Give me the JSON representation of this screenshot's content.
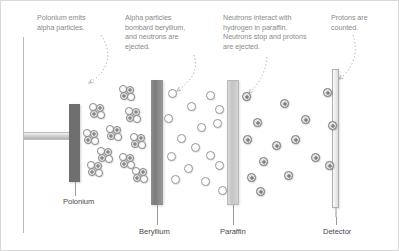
{
  "diagram": {
    "background_color": "#ffffff",
    "annotations": [
      {
        "id": "polonium-note",
        "text": "Polonium emits\nalpha particles.",
        "x": 36,
        "y": 12,
        "width": 72
      },
      {
        "id": "beryllium-note",
        "text": "Alpha particles\nbombard beryllium,\nand neutrons are\nejected.",
        "x": 124,
        "y": 12,
        "width": 76
      },
      {
        "id": "paraffin-note",
        "text": "Neutrons interact with\nhydrogen in paraffin.\nNeutrons stop and protons\nare ejected.",
        "x": 222,
        "y": 12,
        "width": 98
      },
      {
        "id": "detector-note",
        "text": "Protons are\ncounted.",
        "x": 330,
        "y": 12,
        "width": 62
      }
    ],
    "components": [
      {
        "id": "polonium",
        "label": "Polonium",
        "label_x": 62,
        "label_y": 196,
        "lead_x": 74,
        "lead_top": 181,
        "lead_height": 14,
        "color": "#6f6f6f"
      },
      {
        "id": "beryllium",
        "label": "Beryllium",
        "label_x": 138,
        "label_y": 226,
        "lead_x": 156,
        "lead_top": 204,
        "lead_height": 20,
        "color": "#7c7c7c"
      },
      {
        "id": "paraffin",
        "label": "Paraffin",
        "label_x": 219,
        "label_y": 226,
        "lead_x": 232,
        "lead_top": 204,
        "lead_height": 20,
        "color": "#c4c4c4"
      },
      {
        "id": "detector",
        "label": "Detector",
        "label_x": 322,
        "label_y": 226,
        "lead_x": 335,
        "lead_top": 216,
        "lead_height": 8,
        "color": "#ececec"
      }
    ],
    "particles": {
      "alpha_label": "alpha particle",
      "neutron_label": "neutron",
      "proton_label": "proton",
      "alphas": [
        {
          "x": 118,
          "y": 84
        },
        {
          "x": 88,
          "y": 102
        },
        {
          "x": 124,
          "y": 106
        },
        {
          "x": 105,
          "y": 124
        },
        {
          "x": 82,
          "y": 128
        },
        {
          "x": 129,
          "y": 132
        },
        {
          "x": 96,
          "y": 146
        },
        {
          "x": 118,
          "y": 152
        },
        {
          "x": 86,
          "y": 160
        },
        {
          "x": 131,
          "y": 166
        }
      ],
      "neutrons": [
        {
          "x": 167,
          "y": 88
        },
        {
          "x": 205,
          "y": 90
        },
        {
          "x": 186,
          "y": 101
        },
        {
          "x": 214,
          "y": 104
        },
        {
          "x": 163,
          "y": 113
        },
        {
          "x": 196,
          "y": 122
        },
        {
          "x": 212,
          "y": 118
        },
        {
          "x": 176,
          "y": 133
        },
        {
          "x": 190,
          "y": 142
        },
        {
          "x": 166,
          "y": 151
        },
        {
          "x": 205,
          "y": 150
        },
        {
          "x": 183,
          "y": 163
        },
        {
          "x": 214,
          "y": 160
        },
        {
          "x": 170,
          "y": 174
        },
        {
          "x": 200,
          "y": 176
        },
        {
          "x": 217,
          "y": 185
        }
      ],
      "protons": [
        {
          "x": 241,
          "y": 91
        },
        {
          "x": 279,
          "y": 98
        },
        {
          "x": 322,
          "y": 87
        },
        {
          "x": 252,
          "y": 117
        },
        {
          "x": 300,
          "y": 114
        },
        {
          "x": 327,
          "y": 120
        },
        {
          "x": 242,
          "y": 134
        },
        {
          "x": 271,
          "y": 140
        },
        {
          "x": 290,
          "y": 134
        },
        {
          "x": 258,
          "y": 156
        },
        {
          "x": 310,
          "y": 152
        },
        {
          "x": 324,
          "y": 160
        },
        {
          "x": 246,
          "y": 172
        },
        {
          "x": 283,
          "y": 170
        },
        {
          "x": 255,
          "y": 186
        }
      ]
    }
  }
}
